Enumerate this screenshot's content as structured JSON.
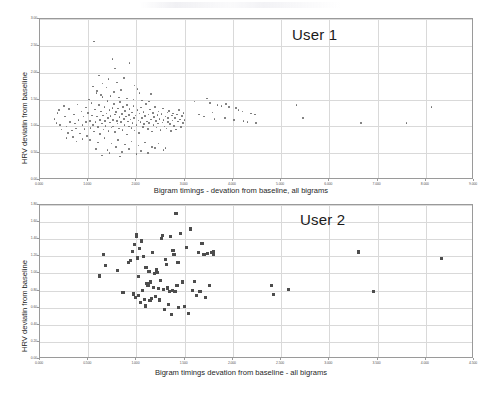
{
  "document": {
    "kind": "scatter-plot-figure",
    "background_color": "#ffffff",
    "marker_color_chart1": "#6b6b6b",
    "marker_color_chart2": "#4d4d4d",
    "grid_color": "#d9d9d9",
    "frame_color": "#9a9a9a"
  },
  "chart_data": [
    {
      "id": "user1",
      "type": "scatter",
      "title": "",
      "annotation": "User 1",
      "xlabel": "Bigram timings - devation from baseline, all bigrams",
      "ylabel": "HRV deviatin from baseline",
      "xlim": [
        0,
        9
      ],
      "ylim": [
        0,
        3
      ],
      "grid": true,
      "legend": "none",
      "xticks": [
        "0.000",
        "1.000",
        "2.000",
        "3.000",
        "4.000",
        "5.000",
        "6.000",
        "7.000",
        "8.000",
        "9.000"
      ],
      "xtick_values": [
        0,
        1,
        2,
        3,
        4,
        5,
        6,
        7,
        8,
        9
      ],
      "yticks": [
        "0.00",
        "0.50",
        "1.00",
        "1.50",
        "2.00",
        "2.50",
        "3.00"
      ],
      "ytick_values": [
        0,
        0.5,
        1.0,
        1.5,
        2.0,
        2.5,
        3.0
      ],
      "marker": "dot",
      "points": [
        [
          0.3,
          1.14
        ],
        [
          0.34,
          1.06
        ],
        [
          0.36,
          1.25
        ],
        [
          0.4,
          1.3
        ],
        [
          0.42,
          1.02
        ],
        [
          0.45,
          0.94
        ],
        [
          0.5,
          1.38
        ],
        [
          0.52,
          1.18
        ],
        [
          0.55,
          1.0
        ],
        [
          0.58,
          0.88
        ],
        [
          0.6,
          1.32
        ],
        [
          0.62,
          1.08
        ],
        [
          0.66,
          0.92
        ],
        [
          0.7,
          1.22
        ],
        [
          0.72,
          1.05
        ],
        [
          0.75,
          0.96
        ],
        [
          0.78,
          1.41
        ],
        [
          0.8,
          1.12
        ],
        [
          0.83,
          0.87
        ],
        [
          0.86,
          1.28
        ],
        [
          0.88,
          1.02
        ],
        [
          0.9,
          1.18
        ],
        [
          0.92,
          0.95
        ],
        [
          0.95,
          1.35
        ],
        [
          0.96,
          1.08
        ],
        [
          0.98,
          0.82
        ],
        [
          1.0,
          1.25
        ],
        [
          1.02,
          1.5
        ],
        [
          1.04,
          1.1
        ],
        [
          1.05,
          0.97
        ],
        [
          1.07,
          1.44
        ],
        [
          1.08,
          1.2
        ],
        [
          1.1,
          1.02
        ],
        [
          1.12,
          0.9
        ],
        [
          1.14,
          1.31
        ],
        [
          1.15,
          1.08
        ],
        [
          1.17,
          1.62
        ],
        [
          1.18,
          1.18
        ],
        [
          1.2,
          0.99
        ],
        [
          1.22,
          1.4
        ],
        [
          1.24,
          1.12
        ],
        [
          1.25,
          0.86
        ],
        [
          1.26,
          1.28
        ],
        [
          1.28,
          1.05
        ],
        [
          1.3,
          1.55
        ],
        [
          1.31,
          1.2
        ],
        [
          1.32,
          0.94
        ],
        [
          1.34,
          1.36
        ],
        [
          1.35,
          1.1
        ],
        [
          1.36,
          1.01
        ],
        [
          1.38,
          1.24
        ],
        [
          1.4,
          1.47
        ],
        [
          1.41,
          1.16
        ],
        [
          1.42,
          0.91
        ],
        [
          1.44,
          1.3
        ],
        [
          1.45,
          1.07
        ],
        [
          1.46,
          1.19
        ],
        [
          1.48,
          0.98
        ],
        [
          1.5,
          1.34
        ],
        [
          1.51,
          1.12
        ],
        [
          1.52,
          1.0
        ],
        [
          1.54,
          1.42
        ],
        [
          1.55,
          1.22
        ],
        [
          1.56,
          0.89
        ],
        [
          1.58,
          1.27
        ],
        [
          1.6,
          1.1
        ],
        [
          1.61,
          1.05
        ],
        [
          1.62,
          1.33
        ],
        [
          1.64,
          0.96
        ],
        [
          1.65,
          1.17
        ],
        [
          1.66,
          1.45
        ],
        [
          1.68,
          1.08
        ],
        [
          1.7,
          1.23
        ],
        [
          1.71,
          0.93
        ],
        [
          1.72,
          1.36
        ],
        [
          1.74,
          1.14
        ],
        [
          1.75,
          1.02
        ],
        [
          1.76,
          1.29
        ],
        [
          1.78,
          1.18
        ],
        [
          1.8,
          0.85
        ],
        [
          1.81,
          1.4
        ],
        [
          1.82,
          1.09
        ],
        [
          1.84,
          1.21
        ],
        [
          1.85,
          1.0
        ],
        [
          1.86,
          1.32
        ],
        [
          1.88,
          1.13
        ],
        [
          1.9,
          0.97
        ],
        [
          1.91,
          1.26
        ],
        [
          1.92,
          1.06
        ],
        [
          1.94,
          1.38
        ],
        [
          1.95,
          1.16
        ],
        [
          1.96,
          0.92
        ],
        [
          1.98,
          1.2
        ],
        [
          2.0,
          1.03
        ],
        [
          2.02,
          1.3
        ],
        [
          2.04,
          1.11
        ],
        [
          2.05,
          0.88
        ],
        [
          2.06,
          1.24
        ],
        [
          2.08,
          1.08
        ],
        [
          2.1,
          1.35
        ],
        [
          2.12,
          1.15
        ],
        [
          2.14,
          0.99
        ],
        [
          2.15,
          1.27
        ],
        [
          2.16,
          1.04
        ],
        [
          2.18,
          1.19
        ],
        [
          2.2,
          1.42
        ],
        [
          2.22,
          1.09
        ],
        [
          2.24,
          0.95
        ],
        [
          2.25,
          1.22
        ],
        [
          2.26,
          1.06
        ],
        [
          2.28,
          1.31
        ],
        [
          2.3,
          1.13
        ],
        [
          2.32,
          0.9
        ],
        [
          2.34,
          1.25
        ],
        [
          2.35,
          1.02
        ],
        [
          2.36,
          1.17
        ],
        [
          2.38,
          1.36
        ],
        [
          2.4,
          1.1
        ],
        [
          2.42,
          0.98
        ],
        [
          2.44,
          1.21
        ],
        [
          2.45,
          1.05
        ],
        [
          2.46,
          1.28
        ],
        [
          2.48,
          1.14
        ],
        [
          2.5,
          0.93
        ],
        [
          2.52,
          1.23
        ],
        [
          2.54,
          1.07
        ],
        [
          2.55,
          1.33
        ],
        [
          2.56,
          1.12
        ],
        [
          2.58,
          1.0
        ],
        [
          2.6,
          1.18
        ],
        [
          2.62,
          0.96
        ],
        [
          2.64,
          1.26
        ],
        [
          2.65,
          1.08
        ],
        [
          2.66,
          1.15
        ],
        [
          2.68,
          1.29
        ],
        [
          2.7,
          1.04
        ],
        [
          2.72,
          0.91
        ],
        [
          2.74,
          1.2
        ],
        [
          2.75,
          1.11
        ],
        [
          2.76,
          1.24
        ],
        [
          2.78,
          1.01
        ],
        [
          2.8,
          1.16
        ],
        [
          2.82,
          0.94
        ],
        [
          2.84,
          1.22
        ],
        [
          2.86,
          1.09
        ],
        [
          2.88,
          1.3
        ],
        [
          2.9,
          1.13
        ],
        [
          2.92,
          0.99
        ],
        [
          2.94,
          1.19
        ],
        [
          2.96,
          1.06
        ],
        [
          2.98,
          1.25
        ],
        [
          3.0,
          1.12
        ],
        [
          1.12,
          2.58
        ],
        [
          1.5,
          2.26
        ],
        [
          1.56,
          2.08
        ],
        [
          1.86,
          2.18
        ],
        [
          1.22,
          1.95
        ],
        [
          1.42,
          1.88
        ],
        [
          1.3,
          1.8
        ],
        [
          1.6,
          1.82
        ],
        [
          1.74,
          1.9
        ],
        [
          1.96,
          1.76
        ],
        [
          2.02,
          1.7
        ],
        [
          1.1,
          1.74
        ],
        [
          1.18,
          1.66
        ],
        [
          1.38,
          1.72
        ],
        [
          1.54,
          1.64
        ],
        [
          1.68,
          1.68
        ],
        [
          2.06,
          1.62
        ],
        [
          2.3,
          1.6
        ],
        [
          1.26,
          1.58
        ],
        [
          1.46,
          1.56
        ],
        [
          1.64,
          1.54
        ],
        [
          1.8,
          1.52
        ],
        [
          1.94,
          1.5
        ],
        [
          2.12,
          1.48
        ],
        [
          2.26,
          1.46
        ],
        [
          3.2,
          1.46
        ],
        [
          3.46,
          1.52
        ],
        [
          3.52,
          1.44
        ],
        [
          3.68,
          1.4
        ],
        [
          3.76,
          1.38
        ],
        [
          3.86,
          1.42
        ],
        [
          3.92,
          1.36
        ],
        [
          4.06,
          1.34
        ],
        [
          4.12,
          1.3
        ],
        [
          4.2,
          1.28
        ],
        [
          4.38,
          1.24
        ],
        [
          4.46,
          1.22
        ],
        [
          3.3,
          1.22
        ],
        [
          3.4,
          1.18
        ],
        [
          3.58,
          1.26
        ],
        [
          3.62,
          1.14
        ],
        [
          3.84,
          1.16
        ],
        [
          4.02,
          1.12
        ],
        [
          4.22,
          1.1
        ],
        [
          4.3,
          1.08
        ],
        [
          4.48,
          1.06
        ],
        [
          5.32,
          1.4
        ],
        [
          5.46,
          1.16
        ],
        [
          6.66,
          1.06
        ],
        [
          7.6,
          1.06
        ],
        [
          8.12,
          1.36
        ],
        [
          0.55,
          0.78
        ],
        [
          0.68,
          0.8
        ],
        [
          0.76,
          0.72
        ],
        [
          0.88,
          0.76
        ],
        [
          1.04,
          0.74
        ],
        [
          1.2,
          0.7
        ],
        [
          1.34,
          0.78
        ],
        [
          1.48,
          0.68
        ],
        [
          1.62,
          0.74
        ],
        [
          1.76,
          0.66
        ],
        [
          1.9,
          0.72
        ],
        [
          2.04,
          0.64
        ],
        [
          2.18,
          0.7
        ],
        [
          2.32,
          0.62
        ],
        [
          2.46,
          0.68
        ],
        [
          2.6,
          0.6
        ],
        [
          1.16,
          0.58
        ],
        [
          1.4,
          0.56
        ],
        [
          1.58,
          0.62
        ],
        [
          1.84,
          0.58
        ],
        [
          2.1,
          0.54
        ],
        [
          2.38,
          0.6
        ],
        [
          1.44,
          0.5
        ],
        [
          1.7,
          0.52
        ],
        [
          2.0,
          0.48
        ],
        [
          2.56,
          0.56
        ],
        [
          1.28,
          0.46
        ],
        [
          1.66,
          0.44
        ],
        [
          2.24,
          0.5
        ]
      ]
    },
    {
      "id": "user2",
      "type": "scatter",
      "title": "",
      "annotation": "User 2",
      "xlabel": "Bigram timings devation from baseline - all bigrams",
      "ylabel": "HRV deviatin from baseline",
      "xlim": [
        0,
        4.5
      ],
      "ylim": [
        0,
        1.8
      ],
      "grid": true,
      "legend": "none",
      "xticks": [
        "0.000",
        "0.500",
        "1.000",
        "1.500",
        "2.000",
        "2.500",
        "3.000",
        "3.500",
        "4.000",
        "4.500"
      ],
      "xtick_values": [
        0,
        0.5,
        1.0,
        1.5,
        2.0,
        2.5,
        3.0,
        3.5,
        4.0,
        4.5
      ],
      "yticks": [
        "0.00",
        "0.20",
        "0.40",
        "0.60",
        "0.80",
        "1.00",
        "1.20",
        "1.40",
        "1.60",
        "1.80"
      ],
      "ytick_values": [
        0,
        0.2,
        0.4,
        0.6,
        0.8,
        1.0,
        1.2,
        1.4,
        1.6,
        1.8
      ],
      "marker": "square",
      "points": [
        [
          0.62,
          0.97
        ],
        [
          0.66,
          1.22
        ],
        [
          0.68,
          1.09
        ],
        [
          0.8,
          1.03
        ],
        [
          0.86,
          0.78
        ],
        [
          0.92,
          1.13
        ],
        [
          0.94,
          1.15
        ],
        [
          0.96,
          1.26
        ],
        [
          0.97,
          0.76
        ],
        [
          0.98,
          1.34
        ],
        [
          0.99,
          0.72
        ],
        [
          1.0,
          1.45
        ],
        [
          1.0,
          1.43
        ],
        [
          1.01,
          1.18
        ],
        [
          1.02,
          0.96
        ],
        [
          1.02,
          0.74
        ],
        [
          1.03,
          1.29
        ],
        [
          1.04,
          0.66
        ],
        [
          1.05,
          1.38
        ],
        [
          1.06,
          0.8
        ],
        [
          1.07,
          1.2
        ],
        [
          1.08,
          0.7
        ],
        [
          1.09,
          0.62
        ],
        [
          1.1,
          1.07
        ],
        [
          1.11,
          0.88
        ],
        [
          1.12,
          0.86
        ],
        [
          1.13,
          1.02
        ],
        [
          1.14,
          0.68
        ],
        [
          1.15,
          0.9
        ],
        [
          1.16,
          0.71
        ],
        [
          1.17,
          1.24
        ],
        [
          1.18,
          0.84
        ],
        [
          1.19,
          1.0
        ],
        [
          1.2,
          0.73
        ],
        [
          1.21,
          1.04
        ],
        [
          1.22,
          1.01
        ],
        [
          1.23,
          0.82
        ],
        [
          1.24,
          0.69
        ],
        [
          1.25,
          0.92
        ],
        [
          1.26,
          1.41
        ],
        [
          1.27,
          1.44
        ],
        [
          1.28,
          0.81
        ],
        [
          1.29,
          0.58
        ],
        [
          1.3,
          1.16
        ],
        [
          1.31,
          1.1
        ],
        [
          1.32,
          0.83
        ],
        [
          1.33,
          0.64
        ],
        [
          1.34,
          0.79
        ],
        [
          1.35,
          1.43
        ],
        [
          1.36,
          0.52
        ],
        [
          1.37,
          0.8
        ],
        [
          1.38,
          1.27
        ],
        [
          1.39,
          1.22
        ],
        [
          1.4,
          0.79
        ],
        [
          1.41,
          1.7
        ],
        [
          1.42,
          0.86
        ],
        [
          1.43,
          1.13
        ],
        [
          1.44,
          0.6
        ],
        [
          1.46,
          1.47
        ],
        [
          1.48,
          0.9
        ],
        [
          1.5,
          0.61
        ],
        [
          1.52,
          1.3
        ],
        [
          1.54,
          0.53
        ],
        [
          1.56,
          1.52
        ],
        [
          1.58,
          0.8
        ],
        [
          1.6,
          0.91
        ],
        [
          1.62,
          0.74
        ],
        [
          1.64,
          1.24
        ],
        [
          1.66,
          0.79
        ],
        [
          1.68,
          1.35
        ],
        [
          1.7,
          1.22
        ],
        [
          1.72,
          0.72
        ],
        [
          1.74,
          1.23
        ],
        [
          1.76,
          0.86
        ],
        [
          1.78,
          1.24
        ],
        [
          1.8,
          1.22
        ],
        [
          1.8,
          1.26
        ],
        [
          2.4,
          0.86
        ],
        [
          2.42,
          0.75
        ],
        [
          2.58,
          0.81
        ],
        [
          3.3,
          1.25
        ],
        [
          3.46,
          0.79
        ],
        [
          4.16,
          1.17
        ]
      ]
    }
  ]
}
